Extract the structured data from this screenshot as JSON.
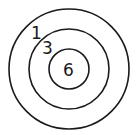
{
  "diagram": {
    "type": "target",
    "rings": [
      {
        "label": "1",
        "radius": 60
      },
      {
        "label": "3",
        "radius": 40
      },
      {
        "label": "6",
        "radius": 20
      }
    ],
    "stroke_color": "#1a1a1a",
    "background": "#ffffff"
  }
}
